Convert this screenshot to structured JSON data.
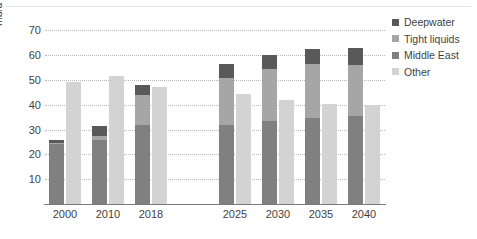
{
  "chart_data": {
    "type": "bar",
    "title": "",
    "subtitle": "",
    "xlabel": "",
    "ylabel": "mb/d",
    "ylim": [
      0,
      75
    ],
    "yticks": [
      10,
      20,
      30,
      40,
      50,
      60,
      70
    ],
    "grid": true,
    "legend_position": "right",
    "categories": [
      "2000",
      "2010",
      "2018",
      "2025",
      "2030",
      "2035",
      "2040"
    ],
    "stacked": true,
    "note": "Each year shows two bars: a left stacked bar (Middle East + Tight liquids + Deepwater) and a right single bar (Other). A gap separates historical years (2000-2018) from projections (2025-2040).",
    "series": [
      {
        "name": "Middle East",
        "color": "#808080",
        "bar": "left",
        "values": [
          24.0,
          26.0,
          32.0,
          32.0,
          33.5,
          34.5,
          35.5
        ]
      },
      {
        "name": "Tight liquids",
        "color": "#a6a6a6",
        "bar": "left",
        "values": [
          0.8,
          1.3,
          12.0,
          19.0,
          21.0,
          22.0,
          20.5
        ]
      },
      {
        "name": "Deepwater",
        "color": "#595959",
        "bar": "left",
        "values": [
          1.2,
          4.2,
          4.0,
          5.5,
          5.5,
          6.0,
          7.0
        ]
      },
      {
        "name": "Other",
        "color": "#d3d3d3",
        "bar": "right",
        "values": [
          49.0,
          51.5,
          47.0,
          44.5,
          42.0,
          40.5,
          40.0
        ]
      }
    ],
    "left_bar_totals": [
      26.0,
      31.5,
      48.0,
      56.5,
      60.0,
      62.5,
      63.0
    ]
  },
  "legend": {
    "items": [
      {
        "label": "Deepwater",
        "color": "#595959"
      },
      {
        "label": "Tight liquids",
        "color": "#a6a6a6"
      },
      {
        "label": "Middle East",
        "color": "#808080"
      },
      {
        "label": "Other",
        "color": "#d3d3d3"
      }
    ]
  },
  "axis": {
    "y_unit_label": "mb/d",
    "y_ticks": [
      "70",
      "60",
      "50",
      "40",
      "30",
      "20",
      "10"
    ],
    "x_ticks": [
      "2000",
      "2010",
      "2018",
      "2025",
      "2030",
      "2035",
      "2040"
    ]
  }
}
